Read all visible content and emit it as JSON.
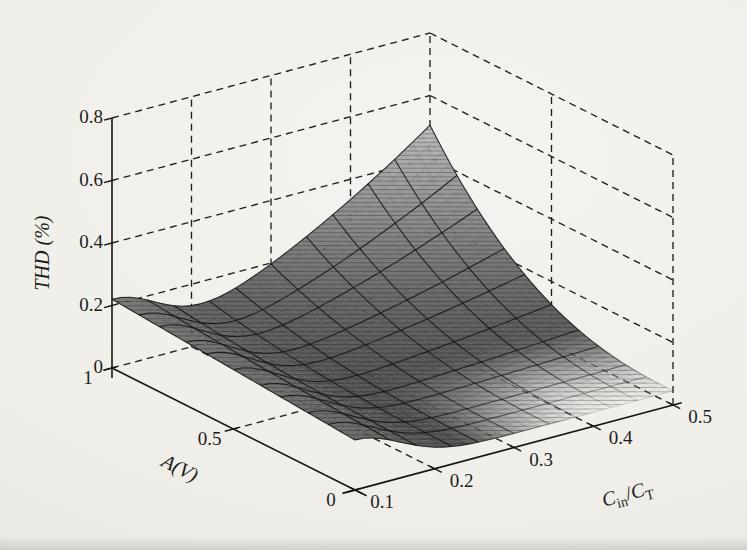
{
  "page": {
    "type": "scanned-journal-figure"
  },
  "colors": {
    "paper": "#f0eeea",
    "ink": "#1f1f1f",
    "surface_dark": "#4e4e4e",
    "surface_light": "#bdbdbd"
  },
  "chart_data": {
    "type": "surface",
    "title": "",
    "xlabel": "Cin/CT",
    "xlabel_parts": [
      {
        "t": "C",
        "style": "italic"
      },
      {
        "t": "in",
        "sub": true
      },
      {
        "t": "/",
        "style": "normal"
      },
      {
        "t": "C",
        "style": "italic"
      },
      {
        "t": "T",
        "sub": true
      }
    ],
    "ylabel": "A(V)",
    "zlabel": "THD (%)",
    "x_axis": {
      "name": "Cin/CT",
      "range": [
        0.1,
        0.5
      ],
      "ticks": [
        "0.1",
        "0.2",
        "0.3",
        "0.4",
        "0.5"
      ]
    },
    "y_axis": {
      "name": "A(V)",
      "range": [
        0,
        1
      ],
      "ticks": [
        "1",
        "0.5",
        "0"
      ]
    },
    "z_axis": {
      "name": "THD (%)",
      "range": [
        0,
        0.8
      ],
      "ticks": [
        "0",
        "0.2",
        "0.4",
        "0.6",
        "0.8"
      ]
    },
    "grid": {
      "style": "dashed",
      "walls": [
        "y-max wall",
        "x-max wall",
        "floor"
      ]
    },
    "view": {
      "azimuth_deg": -37.5,
      "elevation_deg": 30
    },
    "colormap": "gray (light = high THD)",
    "surface_model": {
      "comment": "THD(u,a) = base + (ridge0 + ridgeA*a)*exp(-(u/ridgeW)^2) + peak*u^powU*a^powA ; u=(Cin/CT-0.1)/0.4 ; a=A",
      "base": 0.045,
      "ridge0": 0.115,
      "ridgeA": 0.06,
      "ridgeW": 0.2,
      "peak": 0.46,
      "powU": 1.6,
      "powA": 2.5
    },
    "z_samples": {
      "x_CinCT": [
        0.1,
        0.2,
        0.3,
        0.4,
        0.5
      ],
      "A_V": [
        0,
        0.25,
        0.5,
        0.75,
        1
      ],
      "thd_percent_rows_by_A": [
        [
          0.16,
          0.069,
          0.045,
          0.045,
          0.045
        ],
        [
          0.175,
          0.074,
          0.05,
          0.054,
          0.059
        ],
        [
          0.19,
          0.084,
          0.072,
          0.096,
          0.126
        ],
        [
          0.205,
          0.103,
          0.119,
          0.186,
          0.269
        ],
        [
          0.22,
          0.132,
          0.197,
          0.335,
          0.505
        ]
      ],
      "maximum": {
        "x_CinCT": 0.5,
        "A_V": 1,
        "thd": 0.5
      },
      "minimum_plateau": 0.045
    }
  }
}
